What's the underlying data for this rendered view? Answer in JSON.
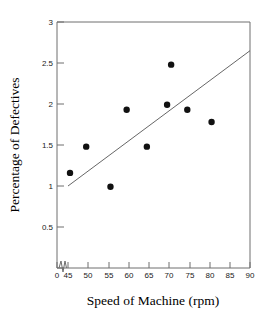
{
  "chart_data": {
    "type": "scatter",
    "title": "",
    "xlabel": "Speed of Machine (rpm)",
    "ylabel": "Percentage of Defectives",
    "xlim": [
      45,
      90
    ],
    "ylim": [
      0,
      3
    ],
    "x_ticks": [
      0,
      45,
      50,
      55,
      60,
      65,
      70,
      75,
      80,
      85,
      90
    ],
    "x_tick_labels": [
      "0",
      "45",
      "50",
      "55",
      "60",
      "65",
      "70",
      "75",
      "80",
      "85",
      "90"
    ],
    "y_ticks": [
      0.5,
      1,
      1.5,
      2,
      2.5,
      3
    ],
    "y_tick_labels": [
      "0.5",
      "1",
      "1.5",
      "2",
      "2.5",
      "3"
    ],
    "axis_break": {
      "axis": "x",
      "between": [
        0,
        45
      ],
      "style": "zigzag"
    },
    "grid": false,
    "legend": "none",
    "points": [
      {
        "x": 45.5,
        "y": 1.16
      },
      {
        "x": 49.5,
        "y": 1.48
      },
      {
        "x": 55.5,
        "y": 0.99
      },
      {
        "x": 59.5,
        "y": 1.93
      },
      {
        "x": 64.5,
        "y": 1.48
      },
      {
        "x": 69.5,
        "y": 1.99
      },
      {
        "x": 70.5,
        "y": 2.48
      },
      {
        "x": 74.5,
        "y": 1.93
      },
      {
        "x": 80.5,
        "y": 1.78
      }
    ],
    "series": [
      {
        "name": "Observations",
        "x": [
          45.5,
          49.5,
          55.5,
          59.5,
          64.5,
          69.5,
          70.5,
          74.5,
          80.5
        ],
        "values": [
          1.16,
          1.48,
          0.99,
          1.93,
          1.48,
          1.99,
          2.48,
          1.93,
          1.78
        ]
      }
    ],
    "trend_line": {
      "name": "Fitted line",
      "x_start": 45,
      "y_start": 1.0,
      "x_end": 90,
      "y_end": 2.65
    },
    "marker": {
      "shape": "circle",
      "color": "#111111",
      "radius_px": 3.2
    },
    "line_color": "#555555",
    "axis_color": "#6e6e6e"
  }
}
